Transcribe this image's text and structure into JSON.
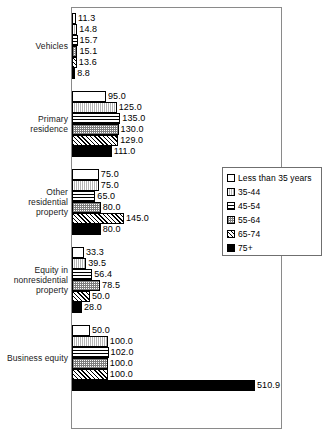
{
  "chart_data": {
    "type": "bar",
    "orientation": "horizontal",
    "title": "",
    "xlabel": "",
    "ylabel": "",
    "grid": false,
    "legend_position": "middle-right",
    "xlim": [
      0,
      589
    ],
    "value_format": "one-decimal",
    "categories": [
      "Vehicles",
      "Primary\nresidence",
      "Other\nresidential\nproperty",
      "Equity in\nnonresidential\nproperty",
      "Business equity"
    ],
    "series": [
      {
        "name": "Less than 35 years",
        "pattern": "white",
        "values": [
          11.3,
          95.0,
          75.0,
          33.3,
          50.0
        ]
      },
      {
        "name": "35-44",
        "pattern": "vertical-lines",
        "values": [
          14.8,
          125.0,
          75.0,
          39.5,
          100.0
        ]
      },
      {
        "name": "45-54",
        "pattern": "horizontal-lines",
        "values": [
          15.7,
          135.0,
          65.0,
          56.4,
          102.0
        ]
      },
      {
        "name": "55-64",
        "pattern": "gray-stipple",
        "values": [
          15.1,
          130.0,
          80.0,
          78.5,
          100.0
        ]
      },
      {
        "name": "65-74",
        "pattern": "diagonal-hatch",
        "values": [
          13.6,
          129.0,
          145.0,
          50.0,
          100.0
        ]
      },
      {
        "name": "75+",
        "pattern": "solid-black",
        "values": [
          8.8,
          111.0,
          80.0,
          28.0,
          510.9
        ]
      }
    ],
    "value_labels": [
      [
        "11.3",
        "14.8",
        "15.7",
        "15.1",
        "13.6",
        "8.8"
      ],
      [
        "95.0",
        "125.0",
        "135.0",
        "130.0",
        "129.0",
        "111.0"
      ],
      [
        "75.0",
        "75.0",
        "65.0",
        "80.0",
        "145.0",
        "80.0"
      ],
      [
        "33.3",
        "39.5",
        "56.4",
        "78.5",
        "50.0",
        "28.0"
      ],
      [
        "50.0",
        "100.0",
        "102.0",
        "100.0",
        "100.0",
        "510.9"
      ]
    ]
  },
  "legend": {
    "items": [
      {
        "label": "Less than 35 years"
      },
      {
        "label": "35-44"
      },
      {
        "label": "45-54"
      },
      {
        "label": "55-64"
      },
      {
        "label": "65-74"
      },
      {
        "label": "75+"
      }
    ]
  },
  "colors": {
    "plot_border": "#8a8a8a",
    "legend_border": "#6f6f6f",
    "bar_outline": "#000000",
    "text": "#000000",
    "background": "#ffffff"
  }
}
